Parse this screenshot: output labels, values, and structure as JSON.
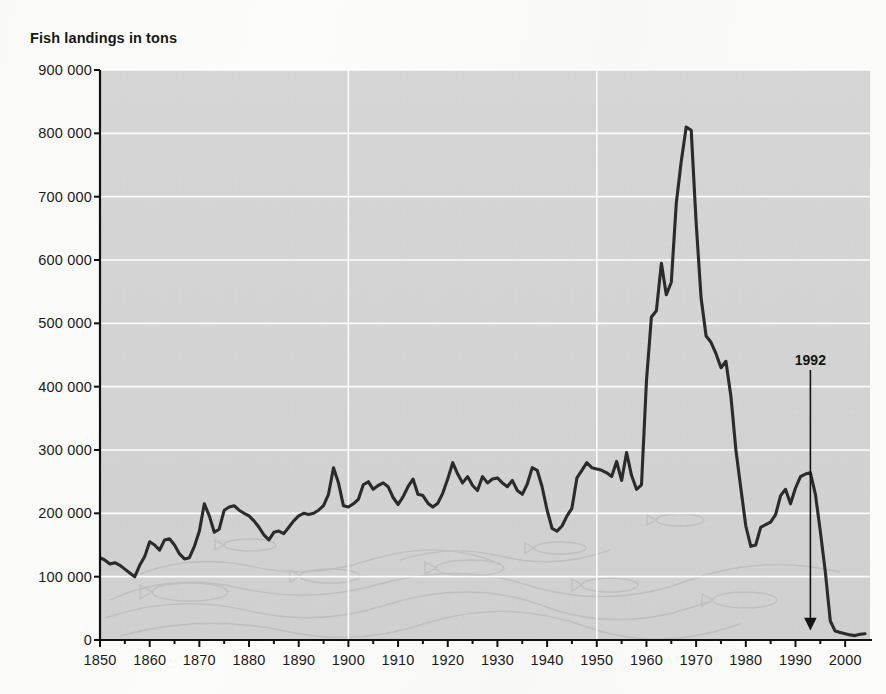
{
  "chart_data": {
    "type": "line",
    "title": "Fish landings in tons",
    "xlabel": "",
    "ylabel": "Fish landings in tons",
    "xlim": [
      1850,
      2005
    ],
    "ylim": [
      0,
      900000
    ],
    "grid": true,
    "legend": "none",
    "xticks": [
      1850,
      1860,
      1870,
      1880,
      1890,
      1900,
      1910,
      1920,
      1930,
      1940,
      1950,
      1960,
      1970,
      1980,
      1990,
      2000
    ],
    "xtick_labels": [
      "1850",
      "1860",
      "1870",
      "1880",
      "1890",
      "1900",
      "1910",
      "1920",
      "1930",
      "1940",
      "1950",
      "1960",
      "1970",
      "1980",
      "1990",
      "2000"
    ],
    "yticks": [
      0,
      100000,
      200000,
      300000,
      400000,
      500000,
      600000,
      700000,
      800000,
      900000
    ],
    "ytick_labels": [
      "0",
      "100 000",
      "200 000",
      "300 000",
      "400 000",
      "500 000",
      "600 000",
      "700 000",
      "800 000",
      "900 000"
    ],
    "gridlines_vertical_years": [
      1900,
      1950
    ],
    "annotations": [
      {
        "text": "1992",
        "x": 1993,
        "y_label": 420000,
        "y_arrow_tip": 18000,
        "type": "arrow-down"
      }
    ],
    "series": [
      {
        "name": "Fish landings",
        "color": "#2b2b2b",
        "x": [
          1850,
          1851,
          1852,
          1853,
          1854,
          1855,
          1856,
          1857,
          1858,
          1859,
          1860,
          1861,
          1862,
          1863,
          1864,
          1865,
          1866,
          1867,
          1868,
          1869,
          1870,
          1871,
          1872,
          1873,
          1874,
          1875,
          1876,
          1877,
          1878,
          1879,
          1880,
          1881,
          1882,
          1883,
          1884,
          1885,
          1886,
          1887,
          1888,
          1889,
          1890,
          1891,
          1892,
          1893,
          1894,
          1895,
          1896,
          1897,
          1898,
          1899,
          1900,
          1901,
          1902,
          1903,
          1904,
          1905,
          1906,
          1907,
          1908,
          1909,
          1910,
          1911,
          1912,
          1913,
          1914,
          1915,
          1916,
          1917,
          1918,
          1919,
          1920,
          1921,
          1922,
          1923,
          1924,
          1925,
          1926,
          1927,
          1928,
          1929,
          1930,
          1931,
          1932,
          1933,
          1934,
          1935,
          1936,
          1937,
          1938,
          1939,
          1940,
          1941,
          1942,
          1943,
          1944,
          1945,
          1946,
          1947,
          1948,
          1949,
          1950,
          1951,
          1952,
          1953,
          1954,
          1955,
          1956,
          1957,
          1958,
          1959,
          1960,
          1961,
          1962,
          1963,
          1964,
          1965,
          1966,
          1967,
          1968,
          1969,
          1970,
          1971,
          1972,
          1973,
          1974,
          1975,
          1976,
          1977,
          1978,
          1979,
          1980,
          1981,
          1982,
          1983,
          1984,
          1985,
          1986,
          1987,
          1988,
          1989,
          1990,
          1991,
          1992,
          1993,
          1994,
          1995,
          1996,
          1997,
          1998,
          1999,
          2000,
          2001,
          2002,
          2003,
          2004
        ],
        "values": [
          130000,
          126000,
          120000,
          122000,
          118000,
          112000,
          106000,
          100000,
          118000,
          132000,
          155000,
          150000,
          142000,
          158000,
          160000,
          150000,
          136000,
          128000,
          130000,
          148000,
          172000,
          215000,
          196000,
          170000,
          175000,
          205000,
          210000,
          212000,
          205000,
          200000,
          196000,
          188000,
          178000,
          166000,
          158000,
          170000,
          172000,
          168000,
          178000,
          188000,
          196000,
          200000,
          198000,
          200000,
          205000,
          212000,
          230000,
          272000,
          248000,
          212000,
          210000,
          215000,
          222000,
          245000,
          250000,
          238000,
          244000,
          248000,
          242000,
          225000,
          214000,
          226000,
          242000,
          254000,
          230000,
          228000,
          216000,
          210000,
          216000,
          232000,
          254000,
          280000,
          262000,
          248000,
          258000,
          244000,
          236000,
          258000,
          248000,
          254000,
          256000,
          248000,
          242000,
          252000,
          236000,
          230000,
          246000,
          272000,
          268000,
          242000,
          205000,
          176000,
          172000,
          180000,
          196000,
          208000,
          256000,
          268000,
          280000,
          272000,
          270000,
          268000,
          264000,
          258000,
          282000,
          252000,
          296000,
          260000,
          238000,
          245000,
          410000,
          510000,
          520000,
          595000,
          545000,
          565000,
          690000,
          755000,
          810000,
          805000,
          660000,
          540000,
          480000,
          470000,
          452000,
          430000,
          440000,
          385000,
          300000,
          240000,
          180000,
          148000,
          150000,
          178000,
          182000,
          186000,
          198000,
          228000,
          238000,
          215000,
          240000,
          258000,
          262000,
          264000,
          230000,
          172000,
          108000,
          30000,
          14000,
          12000,
          10000,
          8000,
          7000,
          9000,
          10000
        ]
      }
    ]
  },
  "axis": {
    "title": "Fish landings in tons"
  }
}
